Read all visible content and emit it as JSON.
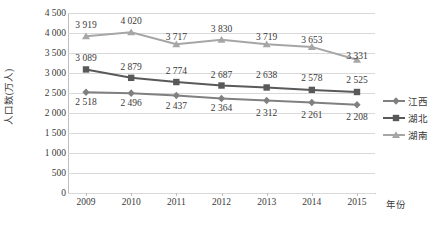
{
  "chart_data": {
    "type": "line",
    "title": "",
    "xlabel": "年份",
    "ylabel": "人口数(万人)",
    "categories": [
      "2009",
      "2010",
      "2011",
      "2012",
      "2013",
      "2014",
      "2015"
    ],
    "ylim": [
      0,
      4500
    ],
    "ytick_labels": [
      "4 500",
      "4 000",
      "3 500",
      "3 000",
      "2 500",
      "2 000",
      "1 500",
      "1 000",
      "500",
      "0"
    ],
    "ytick_values": [
      4500,
      4000,
      3500,
      3000,
      2500,
      2000,
      1500,
      1000,
      500,
      0
    ],
    "grid": true,
    "legend_position": "right",
    "series": [
      {
        "name": "江西",
        "marker": "diamond",
        "color": "#808080",
        "values": [
          2518,
          2496,
          2437,
          2364,
          2312,
          2261,
          2208
        ],
        "labels": [
          "2 518",
          "2 496",
          "2 437",
          "2 364",
          "2 312",
          "2 261",
          "2 208"
        ],
        "label_position": "below"
      },
      {
        "name": "湖北",
        "marker": "square",
        "color": "#595959",
        "values": [
          3089,
          2879,
          2774,
          2687,
          2638,
          2578,
          2525
        ],
        "labels": [
          "3 089",
          "2 879",
          "2 774",
          "2 687",
          "2 638",
          "2 578",
          "2 525"
        ],
        "label_position": "above"
      },
      {
        "name": "湖南",
        "marker": "triangle",
        "color": "#a6a6a6",
        "values": [
          3919,
          4020,
          3717,
          3830,
          3719,
          3653,
          3331
        ],
        "labels": [
          "3 919",
          "4 020",
          "3 717",
          "3 830",
          "3 719",
          "3 653",
          "3 331"
        ],
        "label_position": "above"
      }
    ]
  }
}
